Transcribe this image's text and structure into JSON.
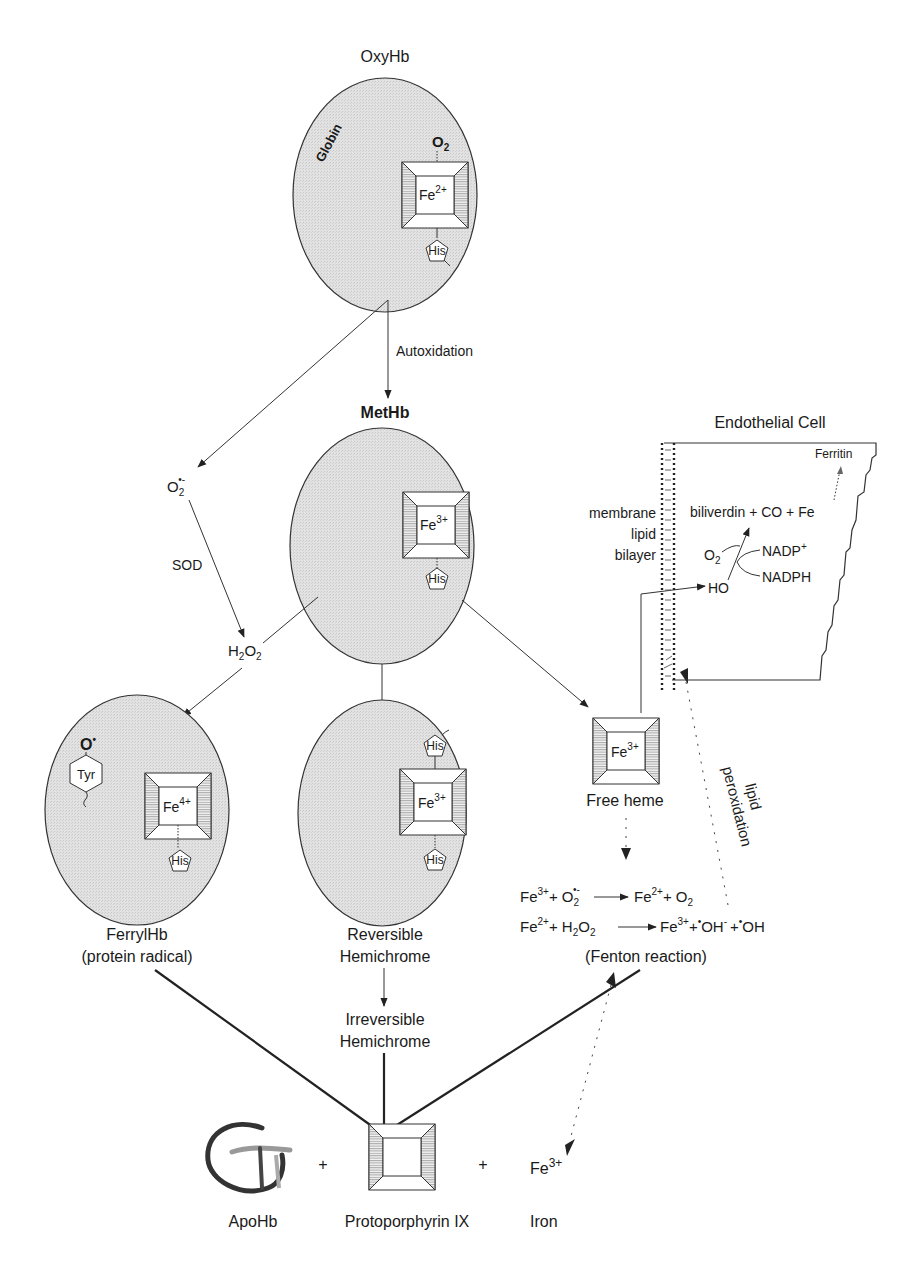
{
  "diagram": {
    "nodes": {
      "oxyhb": {
        "title": "OxyHb",
        "globin_label": "Globin",
        "ligand": "O",
        "ligand_sub": "2",
        "iron": "Fe",
        "iron_charge": "2+",
        "residue": "His"
      },
      "methb": {
        "title": "MetHb",
        "iron": "Fe",
        "iron_charge": "3+",
        "residue": "His"
      },
      "ferrylhb": {
        "label_line1": "FerrylHb",
        "label_line2": "(protein radical)",
        "radical": "O",
        "radical_dot": "•",
        "residue_tyr": "Tyr",
        "iron": "Fe",
        "iron_charge": "4+",
        "residue": "His"
      },
      "rev_hemichrome": {
        "label_line1": "Reversible",
        "label_line2": "Hemichrome",
        "iron": "Fe",
        "iron_charge": "3+",
        "residue_top": "His",
        "residue_bottom": "His"
      },
      "irrev_hemichrome": {
        "label_line1": "Irreversible",
        "label_line2": "Hemichrome"
      },
      "free_heme": {
        "label": "Free heme",
        "iron": "Fe",
        "iron_charge": "3+"
      },
      "superoxide": {
        "base": "O",
        "sub": "2",
        "sup": "•-"
      },
      "peroxide": {
        "h": "H",
        "h_sub": "2",
        "o": "O",
        "o_sub": "2"
      }
    },
    "edges": {
      "autoxidation": "Autoxidation",
      "sod": "SOD",
      "lipid_peroxidation_line1": "lipid",
      "lipid_peroxidation_line2": "peroxidation"
    },
    "fenton": {
      "eq1": {
        "a": "Fe",
        "a_sup": "3+",
        "plus1": "+ O",
        "b_sub": "2",
        "b_sup": "•-",
        "c": "Fe",
        "c_sup": "2+",
        "d": "+ O",
        "d_sub": "2"
      },
      "eq2": {
        "a": "Fe",
        "a_sup": "2+",
        "plus1": "+ H",
        "b_sub": "2",
        "b2": "O",
        "b2_sub": "2",
        "c": "Fe",
        "c_sup": "3+",
        "d": "+",
        "d_dot": "•",
        "d_txt": "OH",
        "d_sup": "-",
        "e": "+",
        "e_dot": "•",
        "e_txt": "OH"
      },
      "label": "(Fenton reaction)"
    },
    "endothelial": {
      "title": "Endothelial Cell",
      "membrane_labels": [
        "membrane",
        "lipid",
        "bilayer"
      ],
      "ferritin": "Ferritin",
      "products": "biliverdin + CO + Fe",
      "o2": "O",
      "o2_sub": "2",
      "nadp": "NADP",
      "nadp_sup": "+",
      "nadph": "NADPH",
      "ho": "HO"
    },
    "products": {
      "apohb": "ApoHb",
      "protoporphyrin": "Protoporphyrin IX",
      "iron_label": "Iron",
      "iron": "Fe",
      "iron_sup": "3+",
      "plus": "+"
    }
  }
}
